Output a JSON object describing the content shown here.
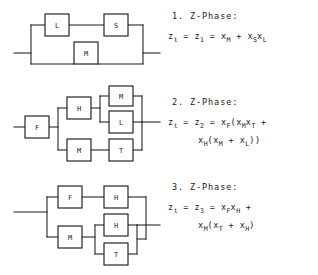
{
  "figure": {
    "ink_color": "#1c1c1c",
    "background_color": "#ffffff"
  },
  "diagrams": [
    {
      "id": "diagram-1",
      "phase_number": "1",
      "components": [
        {
          "label": "L",
          "x": 45,
          "y": 14,
          "w": 24,
          "h": 22
        },
        {
          "label": "S",
          "x": 104,
          "y": 14,
          "w": 24,
          "h": 22
        },
        {
          "label": "M",
          "x": 74,
          "y": 42,
          "w": 24,
          "h": 22
        }
      ],
      "structure": "(L series S) parallel M"
    },
    {
      "id": "diagram-2",
      "phase_number": "2",
      "components": [
        {
          "label": "F",
          "x": 25,
          "y": 116,
          "w": 24,
          "h": 22
        },
        {
          "label": "H",
          "x": 67,
          "y": 97,
          "w": 24,
          "h": 22
        },
        {
          "label": "M",
          "x": 109,
          "y": 86,
          "w": 24,
          "h": 20
        },
        {
          "label": "L",
          "x": 109,
          "y": 111,
          "w": 24,
          "h": 22
        },
        {
          "label": "M",
          "x": 67,
          "y": 139,
          "w": 24,
          "h": 22
        },
        {
          "label": "T",
          "x": 109,
          "y": 139,
          "w": 24,
          "h": 22
        }
      ],
      "structure": "F series ((H series (M parallel L)) parallel (M series T))"
    },
    {
      "id": "diagram-3",
      "phase_number": "3",
      "components": [
        {
          "label": "F",
          "x": 58,
          "y": 186,
          "w": 24,
          "h": 22
        },
        {
          "label": "H",
          "x": 104,
          "y": 186,
          "w": 24,
          "h": 22
        },
        {
          "label": "M",
          "x": 58,
          "y": 226,
          "w": 24,
          "h": 22
        },
        {
          "label": "H",
          "x": 104,
          "y": 214,
          "w": 24,
          "h": 22
        },
        {
          "label": "T",
          "x": 104,
          "y": 243,
          "w": 24,
          "h": 22
        }
      ],
      "structure": "(F series H) parallel (M series (H parallel T))"
    }
  ],
  "formulas": [
    {
      "heading": "1. Z-Phase:",
      "lines": [
        [
          {
            "t": "z"
          },
          {
            "s": "t"
          },
          {
            "t": " = "
          },
          {
            "t": "z"
          },
          {
            "s": "1"
          },
          {
            "t": " = "
          },
          {
            "t": "x"
          },
          {
            "s": "M"
          },
          {
            "t": " + "
          },
          {
            "t": "x"
          },
          {
            "s": "S"
          },
          {
            "t": "x"
          },
          {
            "s": "L"
          }
        ]
      ],
      "plain": "z_t = z_1 = x_M + x_S x_L"
    },
    {
      "heading": "2. Z-Phase:",
      "lines": [
        [
          {
            "t": "z"
          },
          {
            "s": "t"
          },
          {
            "t": " = "
          },
          {
            "t": "z"
          },
          {
            "s": "2"
          },
          {
            "t": " = "
          },
          {
            "t": "x"
          },
          {
            "s": "F"
          },
          {
            "t": "("
          },
          {
            "t": "x"
          },
          {
            "s": "M"
          },
          {
            "t": "x"
          },
          {
            "s": "T"
          },
          {
            "t": " +"
          }
        ],
        [
          {
            "t": "x"
          },
          {
            "s": "H"
          },
          {
            "t": "("
          },
          {
            "t": "x"
          },
          {
            "s": "M"
          },
          {
            "t": " + "
          },
          {
            "t": "x"
          },
          {
            "s": "L"
          },
          {
            "t": "))"
          }
        ]
      ],
      "plain": "z_t = z_2 = x_F(x_M x_T + x_H(x_M + x_L))"
    },
    {
      "heading": "3. Z-Phase:",
      "lines": [
        [
          {
            "t": "z"
          },
          {
            "s": "t"
          },
          {
            "t": " = "
          },
          {
            "t": "z"
          },
          {
            "s": "3"
          },
          {
            "t": " = "
          },
          {
            "t": "x"
          },
          {
            "s": "F"
          },
          {
            "t": "x"
          },
          {
            "s": "H"
          },
          {
            "t": " +"
          }
        ],
        [
          {
            "t": "x"
          },
          {
            "s": "M"
          },
          {
            "t": "("
          },
          {
            "t": "x"
          },
          {
            "s": "T"
          },
          {
            "t": " + "
          },
          {
            "t": "x"
          },
          {
            "s": "H"
          },
          {
            "t": ")"
          }
        ]
      ],
      "plain": "z_t = z_3 = x_F x_H + x_M(x_T + x_H)"
    }
  ]
}
